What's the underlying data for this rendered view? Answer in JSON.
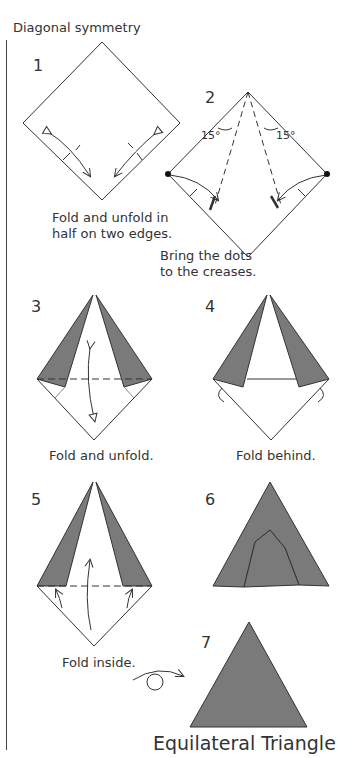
{
  "section_title": "Diagonal symmetry",
  "fill_color": "#7a7a7a",
  "steps": [
    {
      "number": "1",
      "caption_lines": [
        "Fold and unfold in",
        "half on two edges."
      ]
    },
    {
      "number": "2",
      "caption_lines": [
        "Bring the dots",
        "to the creases."
      ],
      "angle_labels": [
        "15°",
        "15°"
      ]
    },
    {
      "number": "3",
      "caption_lines": [
        "Fold and unfold."
      ]
    },
    {
      "number": "4",
      "caption_lines": [
        "Fold behind."
      ]
    },
    {
      "number": "5",
      "caption_lines": [
        "Fold inside."
      ]
    },
    {
      "number": "6",
      "caption_lines": []
    },
    {
      "number": "7",
      "caption_lines": []
    }
  ],
  "final_title": "Equilateral Triangle"
}
